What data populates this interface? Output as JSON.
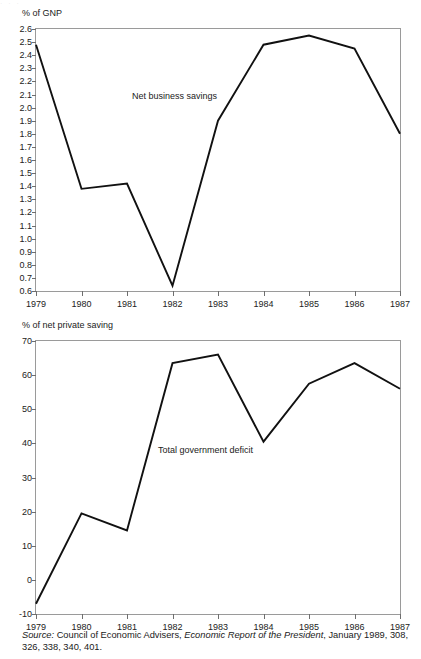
{
  "artifact_top": "·              ·              ·",
  "source_note": {
    "label": "Source:",
    "body_1": " Council of Economic Advisers, ",
    "title": "Economic Report of the President",
    "body_2": ", January 1989, 308, 326, 338, 340, 401."
  },
  "chart_data": [
    {
      "type": "line",
      "title": "",
      "ylabel": "% of GNP",
      "xlabel": "",
      "series_label": "Net business savings",
      "categories": [
        "1979",
        "1980",
        "1981",
        "1982",
        "1983",
        "1984",
        "1985",
        "1986",
        "1987"
      ],
      "x": [
        1979,
        1980,
        1981,
        1982,
        1983,
        1984,
        1985,
        1986,
        1987
      ],
      "values": [
        2.48,
        1.38,
        1.42,
        0.64,
        1.9,
        2.48,
        2.55,
        2.45,
        1.8
      ],
      "ylim": [
        0.6,
        2.6
      ],
      "yticks": [
        "2.6",
        "2.5",
        "2.4",
        "2.3",
        "2.2",
        "2.1",
        "2.0",
        "1.9",
        "1.8",
        "1.7",
        "1.6",
        "1.5",
        "1.4",
        "1.3",
        "1.2",
        "1.1",
        "1.0",
        "0.9",
        "0.8",
        "0.7",
        "0.6"
      ],
      "ytick_values": [
        2.6,
        2.5,
        2.4,
        2.3,
        2.2,
        2.1,
        2.0,
        1.9,
        1.8,
        1.7,
        1.6,
        1.5,
        1.4,
        1.3,
        1.2,
        1.1,
        1.0,
        0.9,
        0.8,
        0.7,
        0.6
      ],
      "grid": false,
      "legend": "inline-annotation"
    },
    {
      "type": "line",
      "title": "",
      "ylabel": "% of net private saving",
      "xlabel": "",
      "series_label": "Total government deficit",
      "categories": [
        "1979",
        "1980",
        "1981",
        "1982",
        "1983",
        "1984",
        "1985",
        "1986",
        "1987"
      ],
      "x": [
        1979,
        1980,
        1981,
        1982,
        1983,
        1984,
        1985,
        1986,
        1987
      ],
      "values": [
        -7,
        19.5,
        14.5,
        63.5,
        66,
        40.5,
        57.5,
        63.5,
        56
      ],
      "ylim": [
        -10,
        70
      ],
      "yticks": [
        "70",
        "60",
        "50",
        "40",
        "30",
        "20",
        "10",
        "0",
        "-10"
      ],
      "ytick_values": [
        70,
        60,
        50,
        40,
        30,
        20,
        10,
        0,
        -10
      ],
      "grid": false,
      "legend": "inline-annotation"
    }
  ],
  "colors": {
    "line": "#111111",
    "frame": "#9a9a9a",
    "text": "#1a1a1a",
    "background": "#ffffff"
  }
}
